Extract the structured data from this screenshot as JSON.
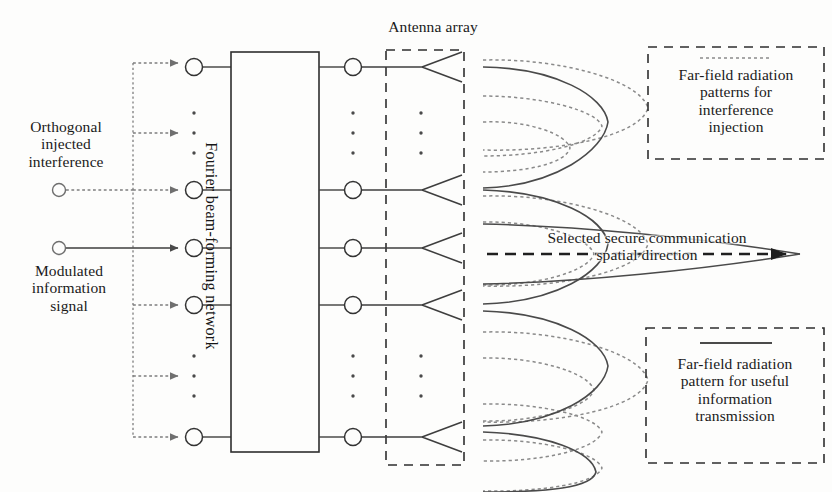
{
  "diagram": {
    "colors": {
      "line": "#3a3a3a",
      "dotted": "#7a7a7a",
      "text": "#1a1a1a",
      "background": "#fdfdfc"
    },
    "blocks": {
      "beamforming_network": {
        "label": "Fourier beam-forming network",
        "input_port_count": 5,
        "output_port_count": 5
      },
      "antenna_array": {
        "label": "Antenna array",
        "element_count": 5
      }
    },
    "sources": {
      "interference": {
        "label": "Orthogonal\ninjected\ninterference",
        "line_style": "dotted",
        "branch_count": 6
      },
      "information": {
        "label": "Modulated\ninformation\nsignal",
        "line_style": "solid",
        "branch_count": 1
      }
    },
    "annotations": {
      "selected_direction": {
        "label": "Selected secure communication\nspatial direction",
        "arrow_style": "dashed"
      }
    },
    "legend": {
      "interference_patterns": {
        "label": "Far-field radiation\npatterns for\ninterference\ninjection",
        "sample_line_style": "dotted"
      },
      "useful_pattern": {
        "label": "Far-field radiation\npattern for useful\ninformation\ntransmission",
        "sample_line_style": "solid"
      }
    },
    "radiation": {
      "solid_lobe_count": 5,
      "dotted_lobe_count": 9,
      "main_beam_direction_deg": 0
    }
  }
}
